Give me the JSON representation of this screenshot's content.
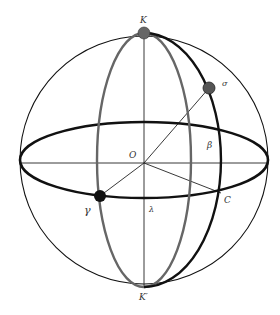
{
  "diagram": {
    "colors": {
      "sphere_outline": "#111111",
      "ecliptic": "#111111",
      "grey_meridian": "#666666",
      "black_meridian": "#111111",
      "pole_point": "#666666",
      "star_point": "#555555",
      "vernal_point": "#111111",
      "axis_lines": "#222222"
    },
    "labels": {
      "north_pole": "K",
      "south_pole": "K′",
      "star": "σ",
      "center": "O",
      "latitude": "β",
      "foot_point": "C",
      "vernal_equinox": "γ",
      "longitude": "λ"
    }
  }
}
